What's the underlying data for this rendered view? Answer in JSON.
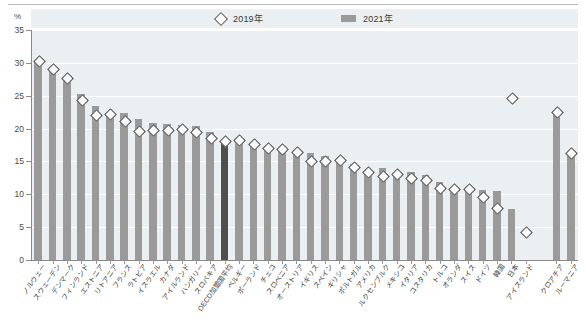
{
  "axis_unit": "%",
  "legend": [
    {
      "label": "2019年",
      "marker": "diamond-marker-icon"
    },
    {
      "label": "2021年",
      "marker": "bar-swatch-icon"
    }
  ],
  "y_ticks": [
    "35",
    "30",
    "25",
    "20",
    "15",
    "10",
    "5",
    "0"
  ],
  "chart_data": {
    "type": "bar",
    "title": "",
    "subtitle": "",
    "xlabel": "",
    "ylabel": "%",
    "ylim": [
      0,
      35
    ],
    "ytick_step": 5,
    "grid": true,
    "legend_position": "top-center",
    "highlight_category": "OECD加盟国平均",
    "highlight_color": "#4f4f4f",
    "bar_color": "#9a9a9a",
    "marker_color": "#4a4a4a",
    "plot_background": "#eceff1",
    "categories": [
      "ノルウェー",
      "スウェーデン",
      "デンマーク",
      "フィンランド",
      "エストニア",
      "リトアニア",
      "フランス",
      "ラトビア",
      "イスラエル",
      "カナダ",
      "アイルランド",
      "ハンガリー",
      "スロバキア",
      "OECD加盟国平均",
      "ベルギー",
      "ポーランド",
      "チェコ",
      "スロベニア",
      "オーストリア",
      "イギリス",
      "スペイン",
      "ギリシャ",
      "ポルトガル",
      "アメリカ",
      "ルクセンブルク",
      "メキシコ",
      "イタリア",
      "コスタリカ",
      "トルコ",
      "オランダ",
      "スイス",
      "ドイツ",
      "韓国",
      "日本",
      "アイスランド",
      "クロアチア",
      "ルーマニア"
    ],
    "series": [
      {
        "name": "2021年",
        "type": "bar",
        "values": [
          30.0,
          28.8,
          27.6,
          25.2,
          23.4,
          22.1,
          22.3,
          21.4,
          20.8,
          20.7,
          20.5,
          20.4,
          19.5,
          18.2,
          18.0,
          17.7,
          17.0,
          16.8,
          16.7,
          16.3,
          15.9,
          15.2,
          14.6,
          13.4,
          14.0,
          13.3,
          13.4,
          12.9,
          11.8,
          11.0,
          10.8,
          10.6,
          10.5,
          7.8,
          null,
          22.6,
          16.3
        ]
      },
      {
        "name": "2019年",
        "type": "scatter-diamond",
        "values": [
          30.3,
          29.2,
          27.8,
          24.4,
          22.1,
          22.3,
          21.3,
          19.7,
          19.8,
          19.8,
          20.0,
          19.5,
          18.6,
          18.2,
          18.4,
          17.7,
          17.1,
          17.0,
          16.5,
          15.1,
          15.2,
          15.3,
          14.2,
          13.5,
          12.8,
          13.2,
          12.5,
          12.2,
          11.1,
          10.9,
          10.9,
          9.7,
          8.0,
          24.8,
          4.3,
          22.6,
          16.3
        ]
      }
    ]
  }
}
